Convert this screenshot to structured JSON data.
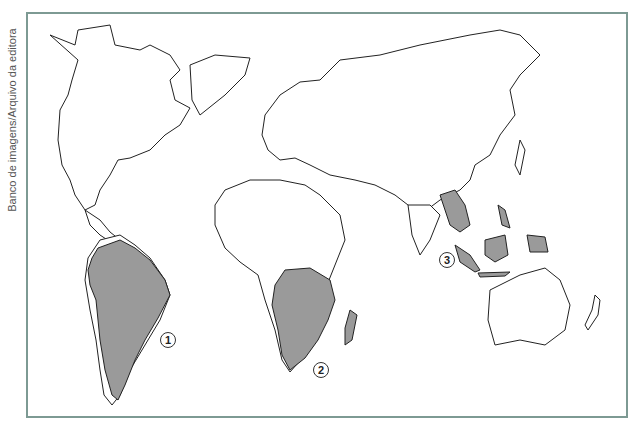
{
  "credit": "Banco de imagens/Arquivo da editora",
  "map": {
    "type": "world-outline",
    "land_fill": "#ffffff",
    "highlight_fill": "#9a9a9a",
    "outline_color": "#222222",
    "frame_color": "#7d9a93"
  },
  "regions": [
    {
      "id": "1",
      "label": "1",
      "area": "South America (Brazil, Venezuela, Paraguay, Uruguay, Argentina)"
    },
    {
      "id": "2",
      "label": "2",
      "area": "Southern Africa (Angola, Congo DR, Zambia, Tanzania, Mozambique, Namibia, Botswana, South Africa, Madagascar)"
    },
    {
      "id": "3",
      "label": "3",
      "area": "Southeast Asia (Myanmar, Thailand, Laos, Cambodia, Philippines, Malaysia, Indonesia, Papua New Guinea)"
    }
  ]
}
